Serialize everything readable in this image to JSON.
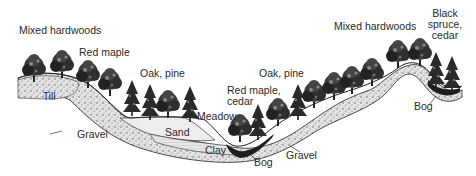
{
  "diagram": {
    "type": "landscape cross-section",
    "labels": {
      "mixed_hardwoods_left": "Mixed hardwoods",
      "red_maple_left": "Red maple",
      "oak_pine_left": "Oak, pine",
      "red_maple_cedar_line1": "Red maple,",
      "red_maple_cedar_line2": "cedar",
      "oak_pine_right": "Oak, pine",
      "mixed_hardwoods_right": "Mixed hardwoods",
      "black_spruce_line1": "Black",
      "black_spruce_line2": "spruce,",
      "black_spruce_line3": "cedar",
      "meadow": "Meadow",
      "sand": "Sand",
      "clay": "Clay",
      "till": "Till",
      "gravel_left": "Gravel",
      "gravel_right": "Gravel",
      "bog_center": "Bog",
      "bog_right": "Bog"
    },
    "colors": {
      "ink": "#1a1a1a",
      "gravel_fill": "#d8d8d8",
      "sand_fill": "#eeeeee",
      "clay_fill": "#e2e2e2",
      "bog_fill": "#1e1e1e",
      "background": "#ffffff"
    }
  }
}
